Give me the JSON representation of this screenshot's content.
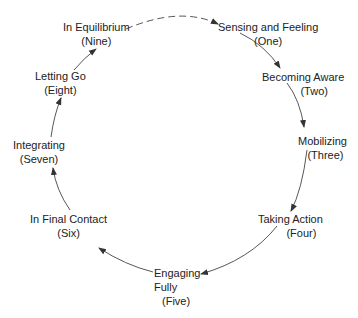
{
  "diagram": {
    "type": "cycle",
    "colors": {
      "line": "#444444",
      "text": "#222222",
      "background": "#ffffff"
    },
    "nodes": [
      {
        "name": "Sensing and Feeling",
        "number": "(One)"
      },
      {
        "name": "Becoming Aware",
        "number": "(Two)"
      },
      {
        "name": "Mobilizing",
        "number": "(Three)"
      },
      {
        "name": "Taking Action",
        "number": "(Four)"
      },
      {
        "name": "Engaging Fully",
        "line1": "Engaging",
        "line2": "Fully",
        "number": "(Five)"
      },
      {
        "name": "In Final Contact",
        "number": "(Six)"
      },
      {
        "name": "Integrating",
        "number": "(Seven)"
      },
      {
        "name": "Letting Go",
        "number": "(Eight)"
      },
      {
        "name": "In Equilibrium",
        "number": "(Nine)"
      }
    ],
    "edges": [
      {
        "from": "One",
        "to": "Two",
        "style": "solid"
      },
      {
        "from": "Two",
        "to": "Three",
        "style": "solid"
      },
      {
        "from": "Three",
        "to": "Four",
        "style": "solid"
      },
      {
        "from": "Four",
        "to": "Five",
        "style": "solid"
      },
      {
        "from": "Five",
        "to": "Six",
        "style": "solid"
      },
      {
        "from": "Six",
        "to": "Seven",
        "style": "solid"
      },
      {
        "from": "Seven",
        "to": "Eight",
        "style": "solid"
      },
      {
        "from": "Eight",
        "to": "Nine",
        "style": "solid"
      },
      {
        "from": "Nine",
        "to": "One",
        "style": "dashed"
      }
    ]
  }
}
